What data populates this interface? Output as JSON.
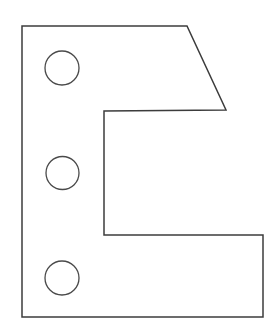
{
  "document": {
    "title": "Mechanical Part Outline Drawing",
    "kind": "engineering-line-drawing",
    "canvas": {
      "width": 273,
      "height": 334,
      "background": "#ffffff"
    }
  },
  "style": {
    "outline_color": "#3c3c3c",
    "outline_width": 1.5,
    "hole_color": "#4a4a4a",
    "hole_width": 1.3,
    "fill_color": "#ffffff"
  },
  "shape": {
    "name": "c-bracket-with-beveled-top-right",
    "description": "C-shaped flat bracket, open to the right, with a chamfered upper-right corner and three round through-holes down the left flange",
    "outline_points": [
      [
        22,
        26
      ],
      [
        187,
        26
      ],
      [
        226,
        110
      ],
      [
        104,
        111
      ],
      [
        104,
        235
      ],
      [
        263,
        235
      ],
      [
        263,
        317
      ],
      [
        22,
        317
      ]
    ],
    "outline_path": "M 22 26 L 187 26 L 226 110 L 104 111 L 104 235 L 263 235 L 263 317 L 22 317 Z",
    "edges": [
      {
        "name": "top-edge",
        "from": [
          22,
          26
        ],
        "to": [
          187,
          26
        ],
        "orientation": "horizontal"
      },
      {
        "name": "bevel-edge",
        "from": [
          187,
          26
        ],
        "to": [
          226,
          110
        ],
        "orientation": "diagonal"
      },
      {
        "name": "upper-arm-underside",
        "from": [
          226,
          110
        ],
        "to": [
          104,
          111
        ],
        "orientation": "horizontal"
      },
      {
        "name": "notch-inner-edge",
        "from": [
          104,
          111
        ],
        "to": [
          104,
          235
        ],
        "orientation": "vertical"
      },
      {
        "name": "lower-arm-topside",
        "from": [
          104,
          235
        ],
        "to": [
          263,
          235
        ],
        "orientation": "horizontal"
      },
      {
        "name": "right-edge",
        "from": [
          263,
          235
        ],
        "to": [
          263,
          317
        ],
        "orientation": "vertical"
      },
      {
        "name": "bottom-edge",
        "from": [
          263,
          317
        ],
        "to": [
          22,
          317
        ],
        "orientation": "horizontal"
      },
      {
        "name": "left-edge",
        "from": [
          22,
          317
        ],
        "to": [
          22,
          26
        ],
        "orientation": "vertical"
      }
    ],
    "holes": [
      {
        "name": "hole-top",
        "cx": 62,
        "cy": 68,
        "r": 17
      },
      {
        "name": "hole-middle",
        "cx": 62.5,
        "cy": 173,
        "r": 16.5
      },
      {
        "name": "hole-bottom",
        "cx": 62,
        "cy": 278,
        "r": 17
      }
    ]
  }
}
